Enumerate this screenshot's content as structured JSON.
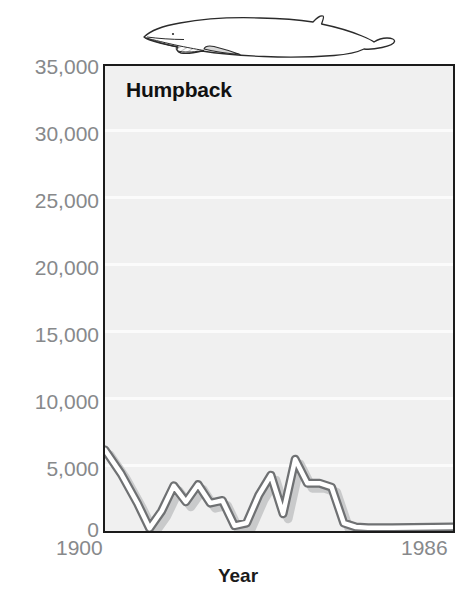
{
  "chart_data": {
    "type": "line",
    "title": "Humpback",
    "xlabel": "Year",
    "ylabel": "",
    "xlim": [
      1900,
      1986
    ],
    "ylim": [
      0,
      35000
    ],
    "grid": true,
    "legend": null,
    "ytick_labels": [
      "35,000",
      "30,000",
      "25,000",
      "20,000",
      "15,000",
      "10,000",
      "5,000",
      "0"
    ],
    "ytick_values": [
      35000,
      30000,
      25000,
      20000,
      15000,
      10000,
      5000,
      0
    ],
    "xtick_labels": [
      "1900",
      "1986"
    ],
    "xtick_values": [
      1900,
      1986
    ],
    "series": [
      {
        "name": "Humpback catch",
        "x": [
          1900,
          1904,
          1908,
          1911,
          1914,
          1917,
          1920,
          1923,
          1926,
          1929,
          1932,
          1935,
          1938,
          1941,
          1944,
          1947,
          1950,
          1953,
          1956,
          1959,
          1962,
          1965,
          1968,
          1971,
          1986
        ],
        "values": [
          6100,
          4300,
          2100,
          200,
          1500,
          3400,
          2200,
          3500,
          2100,
          2300,
          400,
          600,
          2700,
          4200,
          1300,
          5400,
          3600,
          3600,
          3300,
          600,
          300,
          250,
          250,
          250,
          300
        ]
      }
    ],
    "annotations": {
      "illustration": "humpback-whale-line-drawing"
    },
    "colors": {
      "plot_background": "#f0f0f0",
      "gridline": "#fbfbfb",
      "frame": "#1b1b1b",
      "line_fill": "#ffffff",
      "line_stroke": "#6f7173",
      "line_shadow": "#c9cacb",
      "tick_label": "#87898b",
      "title": "#111111"
    }
  }
}
